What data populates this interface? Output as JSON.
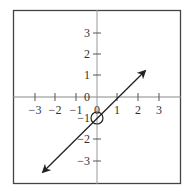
{
  "figure": {
    "x_tick_labels": [
      "−3",
      "−2",
      "−1",
      "0",
      "1",
      "2",
      "3"
    ],
    "y_tick_labels_positive": [
      "3",
      "2",
      "1"
    ],
    "y_tick_labels_negative": [
      "−1",
      "−2",
      "−3"
    ],
    "origin_label": "0",
    "y_origin_label": "0",
    "line": {
      "slope": 1,
      "intercept": -1,
      "arrows": "both"
    },
    "open_circle": {
      "x": 0,
      "y": -1
    },
    "colors": {
      "axis": "#999999",
      "border": "#444444",
      "line": "#222222"
    }
  }
}
